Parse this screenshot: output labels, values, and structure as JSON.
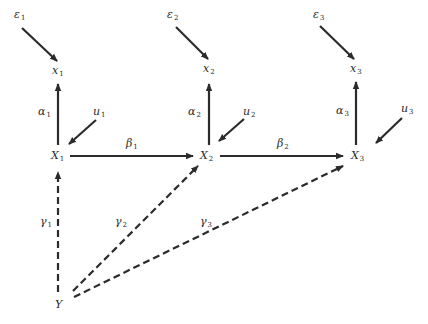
{
  "diagram": {
    "type": "path-diagram",
    "nodes": {
      "e1": {
        "base": "ε",
        "sub": "1"
      },
      "e2": {
        "base": "ε",
        "sub": "2"
      },
      "e3": {
        "base": "ε",
        "sub": "3"
      },
      "x1": {
        "base": "x",
        "sub": "1"
      },
      "x2": {
        "base": "x",
        "sub": "2"
      },
      "x3": {
        "base": "x",
        "sub": "3"
      },
      "u1": {
        "base": "u",
        "sub": "1"
      },
      "u2": {
        "base": "u",
        "sub": "2"
      },
      "u3": {
        "base": "u",
        "sub": "3"
      },
      "X1": {
        "base": "X",
        "sub": "1"
      },
      "X2": {
        "base": "X",
        "sub": "2"
      },
      "X3": {
        "base": "X",
        "sub": "3"
      },
      "Y": {
        "base": "Y",
        "sub": ""
      }
    },
    "edge_labels": {
      "alpha1": {
        "base": "α",
        "sub": "1"
      },
      "alpha2": {
        "base": "α",
        "sub": "2"
      },
      "alpha3": {
        "base": "α",
        "sub": "3"
      },
      "beta1": {
        "base": "β",
        "sub": "1"
      },
      "beta2": {
        "base": "β",
        "sub": "2"
      },
      "gamma1": {
        "base": "γ",
        "sub": "1"
      },
      "gamma2": {
        "base": "γ",
        "sub": "2"
      },
      "gamma3": {
        "base": "γ",
        "sub": "3"
      }
    },
    "edges": [
      {
        "from": "e1",
        "to": "x1",
        "style": "solid"
      },
      {
        "from": "e2",
        "to": "x2",
        "style": "solid"
      },
      {
        "from": "e3",
        "to": "x3",
        "style": "solid"
      },
      {
        "from": "X1",
        "to": "x1",
        "label": "alpha1",
        "style": "solid"
      },
      {
        "from": "X2",
        "to": "x2",
        "label": "alpha2",
        "style": "solid"
      },
      {
        "from": "X3",
        "to": "x3",
        "label": "alpha3",
        "style": "solid"
      },
      {
        "from": "u1",
        "to": "X1",
        "style": "solid"
      },
      {
        "from": "u2",
        "to": "X2",
        "style": "solid"
      },
      {
        "from": "u3",
        "to": "X3",
        "style": "solid"
      },
      {
        "from": "X1",
        "to": "X2",
        "label": "beta1",
        "style": "solid"
      },
      {
        "from": "X2",
        "to": "X3",
        "label": "beta2",
        "style": "solid"
      },
      {
        "from": "Y",
        "to": "X1",
        "label": "gamma1",
        "style": "dashed"
      },
      {
        "from": "Y",
        "to": "X2",
        "label": "gamma2",
        "style": "dashed"
      },
      {
        "from": "Y",
        "to": "X3",
        "label": "gamma3",
        "style": "dashed"
      }
    ],
    "colors": {
      "line": "#2b2b2b",
      "text": "#2a2a2a",
      "background": "#ffffff"
    }
  }
}
